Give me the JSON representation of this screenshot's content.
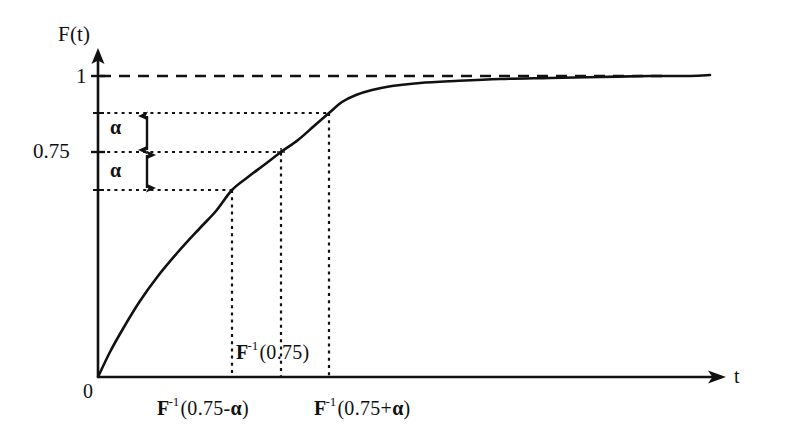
{
  "figure": {
    "title_visible": false,
    "background_color": "#ffffff",
    "ink_color": "#111111"
  },
  "axes": {
    "y_axis_label": "F(t)",
    "x_axis_label": "t",
    "origin_label": "0",
    "y_ticks": [
      {
        "value": 1,
        "label": "1"
      },
      {
        "value": 0.75,
        "label": "0.75"
      }
    ]
  },
  "annotations": {
    "alpha_upper": "α",
    "alpha_lower": "α",
    "x_label_mid_prefix": "F",
    "x_label_mid_sup": "-1",
    "x_label_mid_arg": "(0.75)",
    "x_label_left_prefix": "F",
    "x_label_left_sup": "-1",
    "x_label_left_arg_open": "(0.75-",
    "x_label_left_arg_alpha": "α",
    "x_label_left_arg_close": ")",
    "x_label_right_prefix": "F",
    "x_label_right_sup": "-1",
    "x_label_right_arg_open": "(0.75+",
    "x_label_right_arg_alpha": "α",
    "x_label_right_arg_close": ")"
  },
  "chart_data": {
    "type": "line",
    "title": "",
    "xlabel": "t",
    "ylabel": "F(t)",
    "xlim": [
      0,
      1
    ],
    "ylim": [
      0,
      1.08
    ],
    "grid": false,
    "legend": null,
    "series": [
      {
        "name": "F(t)",
        "style": "solid",
        "points_px": [
          [
            98,
            377
          ],
          [
            110,
            352
          ],
          [
            124,
            327
          ],
          [
            140,
            301
          ],
          [
            158,
            276
          ],
          [
            178,
            252
          ],
          [
            200,
            228
          ],
          [
            216,
            211
          ],
          [
            232,
            190
          ],
          [
            248,
            177
          ],
          [
            264,
            165
          ],
          [
            281,
            152
          ],
          [
            298,
            140
          ],
          [
            314,
            126
          ],
          [
            329,
            113
          ],
          [
            342,
            102
          ],
          [
            356,
            95
          ],
          [
            372,
            90
          ],
          [
            392,
            86
          ],
          [
            420,
            83
          ],
          [
            455,
            81
          ],
          [
            500,
            79
          ],
          [
            550,
            78
          ],
          [
            600,
            77
          ],
          [
            650,
            76
          ],
          [
            690,
            76
          ],
          [
            710,
            75
          ]
        ]
      }
    ],
    "asymptote": {
      "value": 1,
      "style": "dashed",
      "label": "1",
      "y_px": 76,
      "x_start_px": 98,
      "x_end_px": 668
    },
    "marked_levels": [
      {
        "name": "0.75 + alpha",
        "y_px": 113,
        "x_px": 329,
        "style": "dotted"
      },
      {
        "name": "0.75",
        "y_px": 152,
        "x_px": 281,
        "style": "dotted"
      },
      {
        "name": "0.75 - alpha",
        "y_px": 190,
        "x_px": 232,
        "style": "dotted"
      }
    ],
    "marked_quantiles": [
      {
        "name": "F^-1(0.75-alpha)",
        "x_px": 232,
        "label": "F-1(0.75-α)"
      },
      {
        "name": "F^-1(0.75)",
        "x_px": 281,
        "label": "F-1(0.75)"
      },
      {
        "name": "F^-1(0.75+alpha)",
        "x_px": 329,
        "label": "F-1(0.75+α)"
      }
    ],
    "alpha_bands": [
      {
        "name": "upper-alpha",
        "from_y_px": 152,
        "to_y_px": 113,
        "label": "α"
      },
      {
        "name": "lower-alpha",
        "from_y_px": 190,
        "to_y_px": 152,
        "label": "α"
      }
    ]
  }
}
